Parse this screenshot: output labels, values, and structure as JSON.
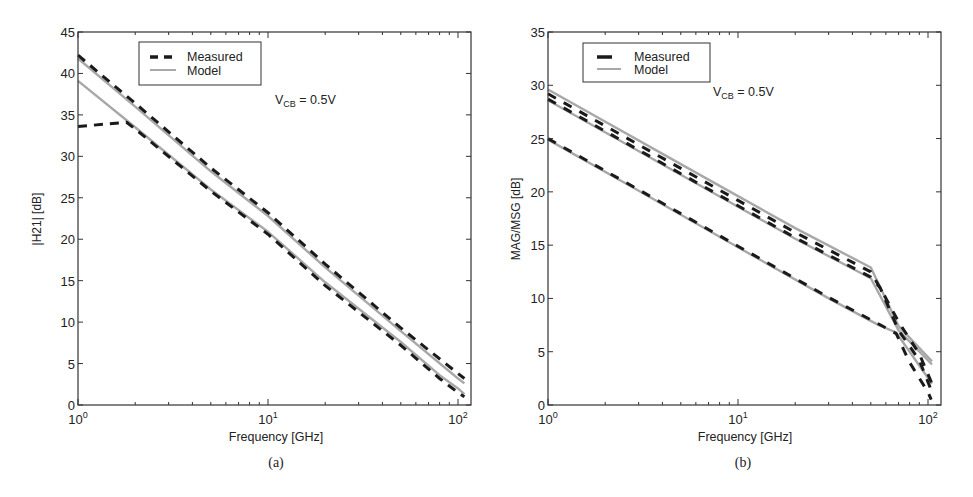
{
  "figure": {
    "panels": [
      {
        "id": "a",
        "caption": "(a)",
        "ylabel": "|H21| [dB]",
        "xlabel": "Frequency [GHz]",
        "annotation": {
          "main": "V",
          "sub": "CB",
          "rest": " = 0.5V"
        },
        "legend": [
          {
            "label": "Measured",
            "style": "dashed-short"
          },
          {
            "label": "Model",
            "style": "solid-gray"
          }
        ]
      },
      {
        "id": "b",
        "caption": "(b)",
        "ylabel": "MAG/MSG [dB]",
        "xlabel": "Frequency [GHz]",
        "annotation": {
          "main": "V",
          "sub": "CB",
          "rest": " = 0.5V"
        },
        "legend": [
          {
            "label": "Measured",
            "style": "dashed-long"
          },
          {
            "label": "Model",
            "style": "solid-gray"
          }
        ]
      }
    ]
  },
  "colors": {
    "measured": "#1a1a1a",
    "model": "#a8a8a8",
    "axes": "#333333",
    "background": "#ffffff"
  },
  "chart_data": [
    {
      "type": "line",
      "title": "",
      "panel_caption": "(a)",
      "xlabel": "Frequency [GHz]",
      "ylabel": "|H21| [dB]",
      "xscale": "log",
      "xlim": [
        1,
        117
      ],
      "ylim": [
        0,
        45
      ],
      "xticks": [
        1,
        10,
        100
      ],
      "xtick_labels": [
        "10^0",
        "10^1",
        "10^2"
      ],
      "yticks": [
        0,
        5,
        10,
        15,
        20,
        25,
        30,
        35,
        40,
        45
      ],
      "grid": false,
      "legend_position": "upper-left (inset)",
      "annotation": "V_CB = 0.5V",
      "series": [
        {
          "name": "Measured (bias 1)",
          "kind": "measured",
          "x": [
            1,
            2,
            5,
            10,
            20,
            50,
            100,
            108
          ],
          "y": [
            42.2,
            36.4,
            28.6,
            23.2,
            17.0,
            9.3,
            3.8,
            3.2
          ]
        },
        {
          "name": "Model (bias 1)",
          "kind": "model",
          "x": [
            1,
            2,
            5,
            10,
            20,
            50,
            100,
            108
          ],
          "y": [
            41.8,
            36.0,
            28.2,
            22.8,
            16.6,
            8.9,
            3.2,
            2.6
          ]
        },
        {
          "name": "Measured (bias 2)",
          "kind": "measured",
          "x": [
            1,
            1.8,
            2,
            5,
            10,
            20,
            50,
            80,
            100,
            108
          ],
          "y": [
            33.6,
            34.1,
            33.3,
            25.8,
            20.6,
            14.4,
            7.2,
            3.2,
            1.5,
            1.0
          ]
        },
        {
          "name": "Model (bias 2)",
          "kind": "model",
          "x": [
            1,
            2,
            5,
            10,
            20,
            50,
            80,
            100,
            108
          ],
          "y": [
            39.1,
            33.5,
            26.0,
            20.9,
            14.8,
            7.6,
            3.6,
            2.0,
            1.3
          ]
        }
      ]
    },
    {
      "type": "line",
      "title": "",
      "panel_caption": "(b)",
      "xlabel": "Frequency [GHz]",
      "ylabel": "MAG/MSG [dB]",
      "xscale": "log",
      "xlim": [
        1,
        117
      ],
      "ylim": [
        0,
        35
      ],
      "xticks": [
        1,
        10,
        100
      ],
      "xtick_labels": [
        "10^0",
        "10^1",
        "10^2"
      ],
      "yticks": [
        0,
        5,
        10,
        15,
        20,
        25,
        30,
        35
      ],
      "grid": false,
      "legend_position": "upper-left (inset)",
      "annotation": "V_CB = 0.5V",
      "series": [
        {
          "name": "Model (bias 1)",
          "kind": "model",
          "x": [
            1,
            5,
            10,
            20,
            50,
            70,
            105
          ],
          "y": [
            29.6,
            22.6,
            19.6,
            16.6,
            12.9,
            7.4,
            4.1
          ]
        },
        {
          "name": "Measured (bias 1)",
          "kind": "measured",
          "x": [
            1,
            5,
            10,
            20,
            50,
            58,
            70,
            90,
            105
          ],
          "y": [
            29.2,
            22.2,
            19.2,
            16.2,
            12.5,
            10.5,
            7.8,
            4.8,
            2.0
          ]
        },
        {
          "name": "Measured (bias 2)",
          "kind": "measured",
          "x": [
            1,
            5,
            10,
            20,
            50,
            56,
            70,
            90,
            105
          ],
          "y": [
            28.7,
            21.7,
            18.7,
            15.7,
            12.0,
            11.0,
            7.0,
            4.2,
            1.2
          ]
        },
        {
          "name": "Model (bias 2)",
          "kind": "model",
          "x": [
            1,
            5,
            10,
            20,
            50,
            70,
            105
          ],
          "y": [
            28.6,
            21.6,
            18.6,
            15.6,
            11.9,
            7.0,
            3.8
          ]
        },
        {
          "name": "Measured (bias 3)",
          "kind": "measured",
          "x": [
            1,
            3,
            10,
            30,
            55,
            68,
            80,
            100,
            104
          ],
          "y": [
            25.0,
            20.2,
            14.9,
            10.1,
            7.6,
            6.7,
            4.0,
            1.2,
            0.5
          ]
        },
        {
          "name": "Model (bias 3)",
          "kind": "model",
          "x": [
            1,
            3,
            10,
            30,
            55,
            68,
            105
          ],
          "y": [
            24.9,
            20.1,
            14.8,
            10.0,
            7.5,
            6.8,
            2.0
          ]
        }
      ]
    }
  ]
}
